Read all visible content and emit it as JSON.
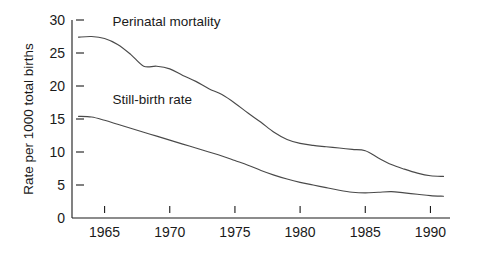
{
  "chart_data": {
    "type": "line",
    "title": "",
    "xlabel": "",
    "ylabel": "Rate per 1000 total births",
    "xlim": [
      1962.5,
      1991.5
    ],
    "ylim": [
      0,
      30
    ],
    "grid": false,
    "legend_position": "inline-annotations",
    "y_ticks": [
      0,
      5,
      10,
      15,
      20,
      25,
      30
    ],
    "y_tick_labels": [
      "0",
      "5",
      "10",
      "15",
      "20",
      "25",
      "30"
    ],
    "x_ticks": [
      1965,
      1970,
      1975,
      1980,
      1985,
      1990
    ],
    "x_tick_labels": [
      "1965",
      "1970",
      "1975",
      "1980",
      "1985",
      "1990"
    ],
    "x": [
      1963,
      1964,
      1965,
      1966,
      1967,
      1968,
      1969,
      1970,
      1971,
      1972,
      1973,
      1974,
      1975,
      1976,
      1977,
      1978,
      1979,
      1980,
      1981,
      1982,
      1983,
      1984,
      1985,
      1986,
      1987,
      1988,
      1989,
      1990,
      1991
    ],
    "series": [
      {
        "name": "Perinatal mortality",
        "label": "Perinatal mortality",
        "color": "#4a4a4a",
        "values": [
          27.4,
          27.5,
          27.2,
          26.3,
          24.8,
          23.0,
          23.0,
          22.6,
          21.6,
          20.7,
          19.6,
          18.7,
          17.4,
          15.9,
          14.5,
          13.0,
          11.9,
          11.3,
          11.0,
          10.8,
          10.6,
          10.4,
          10.2,
          9.1,
          8.1,
          7.4,
          6.8,
          6.4,
          6.3
        ]
      },
      {
        "name": "Still-birth rate",
        "label": "Still-birth rate",
        "color": "#4a4a4a",
        "values": [
          15.4,
          15.3,
          14.8,
          14.2,
          13.6,
          13.0,
          12.4,
          11.8,
          11.2,
          10.6,
          10.0,
          9.4,
          8.7,
          8.0,
          7.2,
          6.5,
          5.9,
          5.4,
          5.0,
          4.6,
          4.2,
          3.9,
          3.8,
          3.9,
          4.0,
          3.8,
          3.6,
          3.4,
          3.3
        ]
      }
    ],
    "annotations": [
      {
        "text": "Perinatal mortality",
        "x": 1965.6,
        "y": 29.1
      },
      {
        "text": "Still-birth rate",
        "x": 1965.6,
        "y": 17.2
      }
    ]
  }
}
